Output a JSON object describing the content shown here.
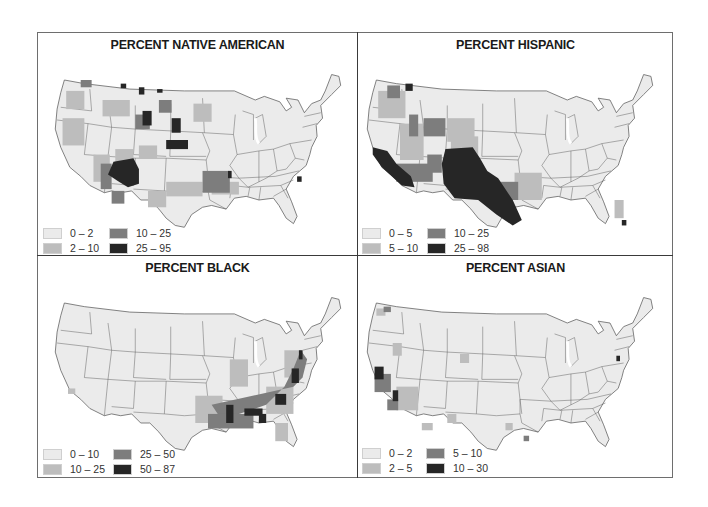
{
  "figure": {
    "palette": {
      "c1": "#ebebeb",
      "c2": "#bdbdbd",
      "c3": "#7d7d7d",
      "c4": "#262626",
      "state_border": "#4a4a4a",
      "frame": "#6e6e6e"
    }
  },
  "panels": [
    {
      "id": "native-american",
      "title": "PERCENT NATIVE AMERICAN",
      "legend": [
        {
          "label": "0 – 2",
          "color": "#ebebeb"
        },
        {
          "label": "2 – 10",
          "color": "#bdbdbd"
        },
        {
          "label": "10 – 25",
          "color": "#7d7d7d"
        },
        {
          "label": "25 – 95",
          "color": "#262626"
        }
      ]
    },
    {
      "id": "hispanic",
      "title": "PERCENT HISPANIC",
      "legend": [
        {
          "label": "0 – 5",
          "color": "#ebebeb"
        },
        {
          "label": "5 – 10",
          "color": "#bdbdbd"
        },
        {
          "label": "10 – 25",
          "color": "#7d7d7d"
        },
        {
          "label": "25 – 98",
          "color": "#262626"
        }
      ]
    },
    {
      "id": "black",
      "title": "PERCENT BLACK",
      "legend": [
        {
          "label": "0 – 10",
          "color": "#ebebeb"
        },
        {
          "label": "10 – 25",
          "color": "#bdbdbd"
        },
        {
          "label": "25 – 50",
          "color": "#7d7d7d"
        },
        {
          "label": "50 – 87",
          "color": "#262626"
        }
      ]
    },
    {
      "id": "asian",
      "title": "PERCENT ASIAN",
      "legend": [
        {
          "label": "0 – 2",
          "color": "#ebebeb"
        },
        {
          "label": "2 – 5",
          "color": "#bdbdbd"
        },
        {
          "label": "5 – 10",
          "color": "#7d7d7d"
        },
        {
          "label": "10 – 30",
          "color": "#262626"
        }
      ]
    }
  ]
}
